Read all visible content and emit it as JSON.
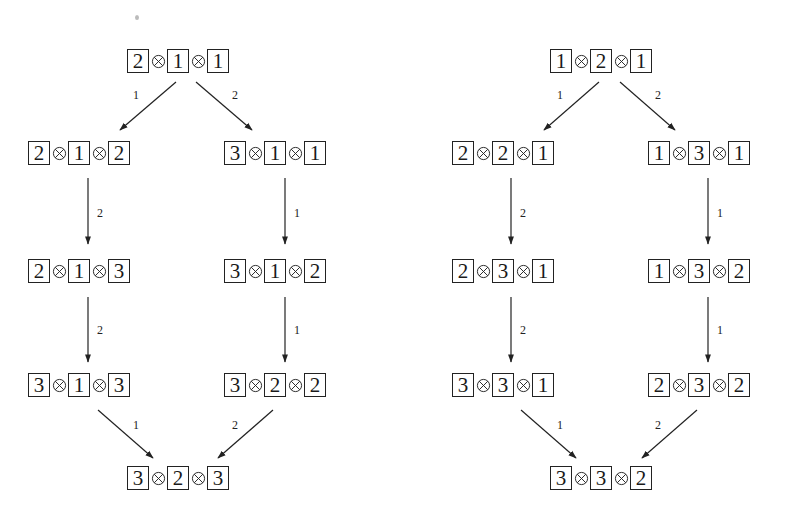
{
  "diagrams": [
    {
      "id": "left",
      "nodes": [
        {
          "id": "L0",
          "values": [
            "2",
            "1",
            "1"
          ],
          "x": 127,
          "y": 48
        },
        {
          "id": "L1a",
          "values": [
            "2",
            "1",
            "2"
          ],
          "x": 28,
          "y": 140
        },
        {
          "id": "L1b",
          "values": [
            "3",
            "1",
            "1"
          ],
          "x": 224,
          "y": 140
        },
        {
          "id": "L2a",
          "values": [
            "2",
            "1",
            "3"
          ],
          "x": 28,
          "y": 258
        },
        {
          "id": "L2b",
          "values": [
            "3",
            "1",
            "2"
          ],
          "x": 224,
          "y": 258
        },
        {
          "id": "L3a",
          "values": [
            "3",
            "1",
            "3"
          ],
          "x": 28,
          "y": 372
        },
        {
          "id": "L3b",
          "values": [
            "3",
            "2",
            "2"
          ],
          "x": 224,
          "y": 372
        },
        {
          "id": "L4",
          "values": [
            "3",
            "2",
            "3"
          ],
          "x": 127,
          "y": 465
        }
      ],
      "edges": [
        {
          "from": "L0",
          "to": "L1a",
          "label": "1",
          "x1": 176,
          "y1": 82,
          "x2": 120,
          "y2": 130,
          "lx": 133,
          "ly": 88
        },
        {
          "from": "L0",
          "to": "L1b",
          "label": "2",
          "x1": 196,
          "y1": 82,
          "x2": 252,
          "y2": 130,
          "lx": 232,
          "ly": 88
        },
        {
          "from": "L1a",
          "to": "L2a",
          "label": "2",
          "x1": 88,
          "y1": 178,
          "x2": 88,
          "y2": 244,
          "lx": 97,
          "ly": 206
        },
        {
          "from": "L1b",
          "to": "L2b",
          "label": "1",
          "x1": 285,
          "y1": 178,
          "x2": 285,
          "y2": 244,
          "lx": 294,
          "ly": 206
        },
        {
          "from": "L2a",
          "to": "L3a",
          "label": "2",
          "x1": 88,
          "y1": 297,
          "x2": 88,
          "y2": 362,
          "lx": 97,
          "ly": 323
        },
        {
          "from": "L2b",
          "to": "L3b",
          "label": "1",
          "x1": 285,
          "y1": 297,
          "x2": 285,
          "y2": 362,
          "lx": 294,
          "ly": 323
        },
        {
          "from": "L3a",
          "to": "L4",
          "label": "1",
          "x1": 98,
          "y1": 410,
          "x2": 153,
          "y2": 458,
          "lx": 133,
          "ly": 418
        },
        {
          "from": "L3b",
          "to": "L4",
          "label": "2",
          "x1": 273,
          "y1": 410,
          "x2": 218,
          "y2": 458,
          "lx": 232,
          "ly": 418
        }
      ]
    },
    {
      "id": "right",
      "nodes": [
        {
          "id": "R0",
          "values": [
            "1",
            "2",
            "1"
          ],
          "x": 550,
          "y": 48
        },
        {
          "id": "R1a",
          "values": [
            "2",
            "2",
            "1"
          ],
          "x": 452,
          "y": 140
        },
        {
          "id": "R1b",
          "values": [
            "1",
            "3",
            "1"
          ],
          "x": 648,
          "y": 140
        },
        {
          "id": "R2a",
          "values": [
            "2",
            "3",
            "1"
          ],
          "x": 452,
          "y": 258
        },
        {
          "id": "R2b",
          "values": [
            "1",
            "3",
            "2"
          ],
          "x": 648,
          "y": 258
        },
        {
          "id": "R3a",
          "values": [
            "3",
            "3",
            "1"
          ],
          "x": 452,
          "y": 372
        },
        {
          "id": "R3b",
          "values": [
            "2",
            "3",
            "2"
          ],
          "x": 648,
          "y": 372
        },
        {
          "id": "R4",
          "values": [
            "3",
            "3",
            "2"
          ],
          "x": 550,
          "y": 465
        }
      ],
      "edges": [
        {
          "from": "R0",
          "to": "R1a",
          "label": "1",
          "x1": 599,
          "y1": 82,
          "x2": 544,
          "y2": 130,
          "lx": 557,
          "ly": 88
        },
        {
          "from": "R0",
          "to": "R1b",
          "label": "2",
          "x1": 620,
          "y1": 82,
          "x2": 675,
          "y2": 130,
          "lx": 655,
          "ly": 88
        },
        {
          "from": "R1a",
          "to": "R2a",
          "label": "2",
          "x1": 511,
          "y1": 178,
          "x2": 511,
          "y2": 244,
          "lx": 520,
          "ly": 206
        },
        {
          "from": "R1b",
          "to": "R2b",
          "label": "1",
          "x1": 708,
          "y1": 178,
          "x2": 708,
          "y2": 244,
          "lx": 717,
          "ly": 206
        },
        {
          "from": "R2a",
          "to": "R3a",
          "label": "2",
          "x1": 511,
          "y1": 297,
          "x2": 511,
          "y2": 362,
          "lx": 520,
          "ly": 323
        },
        {
          "from": "R2b",
          "to": "R3b",
          "label": "1",
          "x1": 708,
          "y1": 297,
          "x2": 708,
          "y2": 362,
          "lx": 717,
          "ly": 323
        },
        {
          "from": "R3a",
          "to": "R4",
          "label": "1",
          "x1": 521,
          "y1": 410,
          "x2": 576,
          "y2": 458,
          "lx": 557,
          "ly": 418
        },
        {
          "from": "R3b",
          "to": "R4",
          "label": "2",
          "x1": 697,
          "y1": 410,
          "x2": 642,
          "y2": 458,
          "lx": 655,
          "ly": 418
        }
      ]
    }
  ],
  "operator_symbol": "otimes",
  "colors": {
    "ink": "#222222",
    "background": "#ffffff"
  }
}
